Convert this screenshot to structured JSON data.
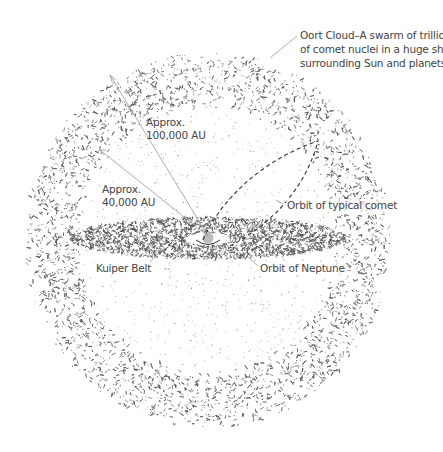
{
  "diagram": {
    "colors": {
      "background": "#ffffff",
      "particles": "#555555",
      "leader_lines": "#999999",
      "sun": "#bdbdbd",
      "comet_orbit": "#333333",
      "text": "#444444"
    },
    "labels": {
      "oort_cloud": {
        "line1": "Oort Cloud–A swarm of trillions",
        "line2": "of comet nuclei in a huge shell",
        "line3": "surrounding Sun and planets."
      },
      "outer_distance": {
        "line1": "Approx.",
        "line2": "100,000 AU"
      },
      "inner_distance": {
        "line1": "Approx.",
        "line2": "40,000 AU"
      },
      "comet_orbit": "Orbit of typical comet",
      "kuiper_belt": "Kuiper Belt",
      "neptune_orbit": "Orbit of Neptune"
    },
    "elements": [
      {
        "name": "oort-cloud-shell",
        "shape": "annulus",
        "outer_radius_au": 100000,
        "inner_radius_au": 40000
      },
      {
        "name": "kuiper-belt-disc",
        "shape": "flattened ellipse"
      },
      {
        "name": "sun",
        "shape": "circle"
      },
      {
        "name": "comet-orbit",
        "shape": "dashed ellipse"
      }
    ]
  }
}
